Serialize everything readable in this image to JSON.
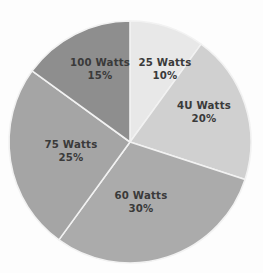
{
  "chart_data": {
    "type": "pie",
    "title": "",
    "subtitle": "",
    "xlabel": "",
    "ylabel": "",
    "legend": "none",
    "grid": false,
    "start_angle_deg": 0,
    "direction": "clockwise",
    "background_color": "#fdfdfd",
    "separator_color": "#f2f2f2",
    "label_color": "#3a3a3a",
    "categories": [
      "25 Watts",
      "4U Watts",
      "60 Watts",
      "75 Watts",
      "100 Watts"
    ],
    "values": [
      10,
      20,
      30,
      25,
      15
    ],
    "value_labels": [
      "10%",
      "20%",
      "30%",
      "25%",
      "15%"
    ],
    "colors": [
      "#e8e8e8",
      "#d0d0d0",
      "#ababab",
      "#a5a5a5",
      "#8e8e8e"
    ],
    "slices": [
      {
        "label": "25 Watts",
        "percent_label": "10%",
        "value": 10,
        "color": "#e8e8e8",
        "label_x": 165,
        "label_y": 66,
        "pct_x": 165,
        "pct_y": 79
      },
      {
        "label": "4U Watts",
        "percent_label": "20%",
        "value": 20,
        "color": "#d0d0d0",
        "label_x": 204,
        "label_y": 109,
        "pct_x": 204,
        "pct_y": 122
      },
      {
        "label": "60 Watts",
        "percent_label": "30%",
        "value": 30,
        "color": "#ababab",
        "label_x": 141,
        "label_y": 199,
        "pct_x": 141,
        "pct_y": 212
      },
      {
        "label": "75 Watts",
        "percent_label": "25%",
        "value": 25,
        "color": "#a5a5a5",
        "label_x": 71,
        "label_y": 148,
        "pct_x": 71,
        "pct_y": 161
      },
      {
        "label": "100 Watts",
        "percent_label": "15%",
        "value": 15,
        "color": "#8e8e8e",
        "label_x": 100,
        "label_y": 66,
        "pct_x": 100,
        "pct_y": 79
      }
    ],
    "geometry": {
      "center_x": 130,
      "center_y": 142,
      "radius": 121
    },
    "total": 100
  }
}
